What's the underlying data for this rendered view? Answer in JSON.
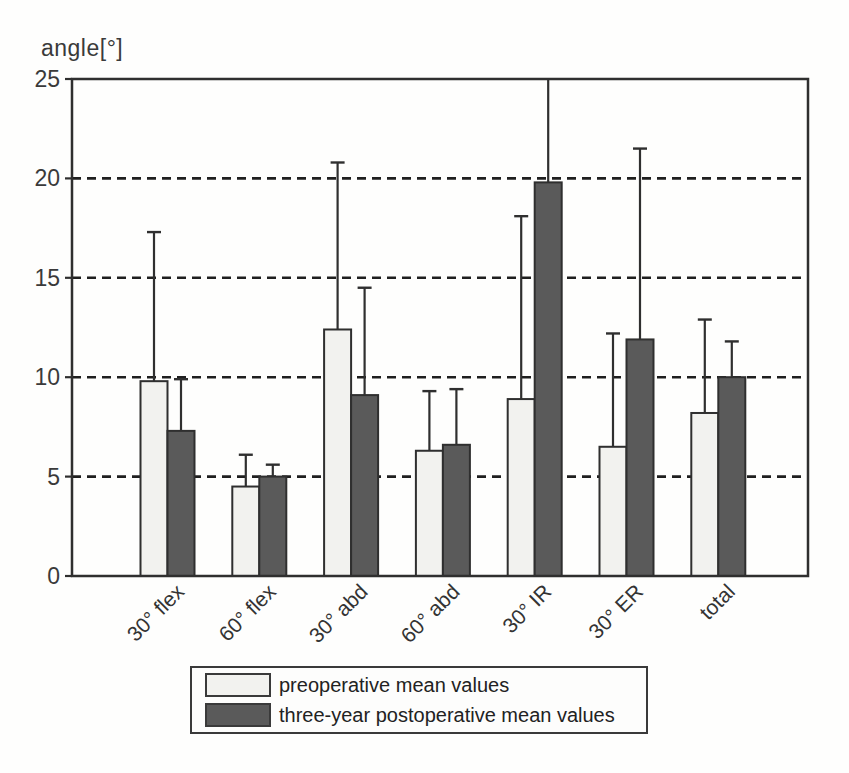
{
  "figure": {
    "title": "angle[°]",
    "description_visible_elements": "grouped bar chart with upper error bars, boxed legend below axis"
  },
  "chart_data": {
    "type": "bar",
    "title": "angle[°]",
    "ylabel": "angle[°]",
    "xlabel": "",
    "categories": [
      "30° flex",
      "60° flex",
      "30° abd",
      "60° abd",
      "30° IR",
      "30° ER",
      "total"
    ],
    "series": [
      {
        "name": "preoperative mean values",
        "color": "#f2f2ef",
        "values": [
          9.8,
          4.5,
          12.4,
          6.3,
          8.9,
          6.5,
          8.2
        ],
        "error_tops": [
          17.3,
          6.1,
          20.8,
          9.3,
          18.1,
          12.2,
          12.9
        ]
      },
      {
        "name": "three-year postoperative mean values",
        "color": "#5a5a5a",
        "values": [
          7.3,
          5.0,
          9.1,
          6.6,
          19.8,
          11.9,
          10.0
        ],
        "error_tops": [
          9.9,
          5.6,
          14.5,
          9.4,
          25,
          21.5,
          11.8
        ]
      }
    ],
    "ylim": [
      0,
      25
    ],
    "yticks": [
      0,
      5,
      10,
      15,
      20,
      25
    ],
    "grid": "horizontal dashed lines at 5, 10, 15, 20",
    "legend_position": "below chart, boxed",
    "error_bars": "upper whiskers only; 30° IR postoperative whisker clipped at 25",
    "x_tick_label_rotation": 45
  },
  "colors": {
    "outline": "#2f2f2f",
    "grid": "#1f1f1f",
    "text": "#333333",
    "background": "#fefefd"
  }
}
